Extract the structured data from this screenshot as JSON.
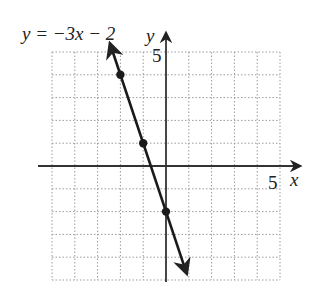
{
  "chart_data": {
    "type": "line",
    "title": "y = −3x − 2",
    "equation": "y = −3x − 2",
    "xlabel": "x",
    "ylabel": "y",
    "xlim": [
      -5,
      5
    ],
    "ylim": [
      -5,
      5
    ],
    "grid": true,
    "grid_style": "dotted",
    "tick_labels": {
      "x": "5",
      "y": "5"
    },
    "slope": -3,
    "intercept": -2,
    "points": [
      {
        "x": -2,
        "y": 4
      },
      {
        "x": -1,
        "y": 1
      },
      {
        "x": 0,
        "y": -2
      }
    ],
    "line_extent": {
      "from": {
        "x": -2.45,
        "y": 5.35
      },
      "to": {
        "x": 0.9,
        "y": -4.7
      }
    },
    "arrows": "both ends"
  },
  "labels": {
    "equation": "y = −3x − 2",
    "x_axis": "x",
    "y_axis": "y",
    "x_tick": "5",
    "y_tick": "5"
  },
  "colors": {
    "line": "#1a1a1a",
    "axis": "#333333",
    "grid": "#9a9a9a"
  }
}
